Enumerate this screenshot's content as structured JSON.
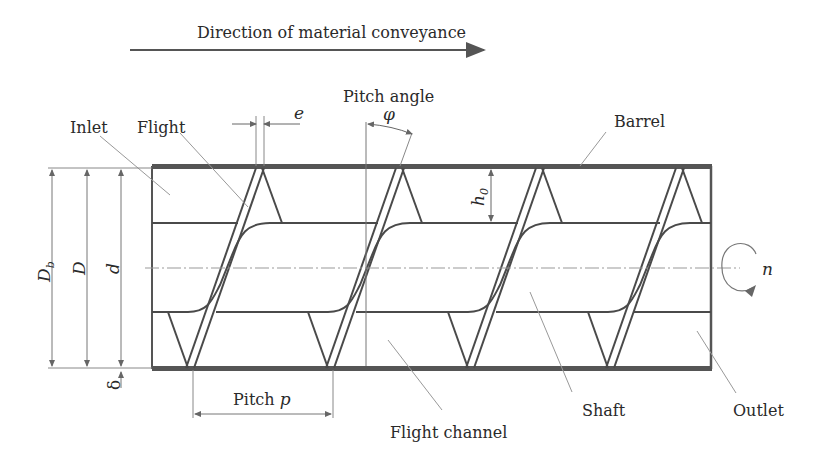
{
  "direction_label": "Direction of material conveyance",
  "labels": {
    "inlet": "Inlet",
    "flight": "Flight",
    "pitch_angle": "Pitch angle",
    "barrel": "Barrel",
    "shaft": "Shaft",
    "outlet": "Outlet",
    "flight_channel": "Flight channel",
    "pitch": "Pitch"
  },
  "symbols": {
    "flight_width": "e",
    "pitch_angle": "φ",
    "channel_depth": "h",
    "channel_depth_sub": "0",
    "barrel_diameter": "D",
    "barrel_diameter_sub": "b",
    "screw_diameter": "D",
    "shaft_diameter": "d",
    "clearance": "δ",
    "pitch": "p",
    "rotation_speed": "n"
  },
  "colors": {
    "line": "#4a4a4a",
    "barrel": "#555555",
    "thin": "#8a8a8a",
    "text": "#2a2a2a"
  }
}
